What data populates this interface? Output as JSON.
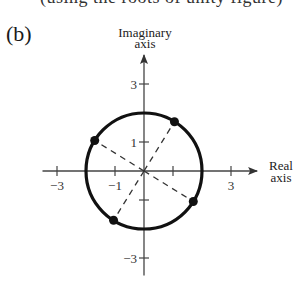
{
  "cut_off_text": "(using the roots of unity figure)",
  "panel_label": "(b)",
  "chart_data": {
    "type": "scatter",
    "title": "",
    "xlabel": "Real axis",
    "xlabel_lines": [
      "Real",
      "axis"
    ],
    "ylabel": "Imaginary axis",
    "ylabel_lines": [
      "Imaginary",
      "axis"
    ],
    "xlim": [
      -3.5,
      3.9
    ],
    "ylim": [
      -3.6,
      4.0
    ],
    "x_ticks": [
      -3,
      -1,
      1,
      3
    ],
    "x_tick_labels": [
      "−3",
      "−1",
      "",
      "3"
    ],
    "y_ticks": [
      3,
      1,
      -1,
      -3
    ],
    "y_tick_labels": [
      "3",
      "1",
      "",
      "−3"
    ],
    "grid": false,
    "circle": {
      "center": [
        0,
        0
      ],
      "radius": 2
    },
    "points": [
      {
        "x": 1.05,
        "y": 1.7,
        "angle_deg": 58.3
      },
      {
        "x": -1.7,
        "y": 1.05,
        "angle_deg": 148.3
      },
      {
        "x": -1.05,
        "y": -1.7,
        "angle_deg": 238.3
      },
      {
        "x": 1.7,
        "y": -1.05,
        "angle_deg": 328.3
      }
    ],
    "dashed_rays_from_origin": true
  }
}
